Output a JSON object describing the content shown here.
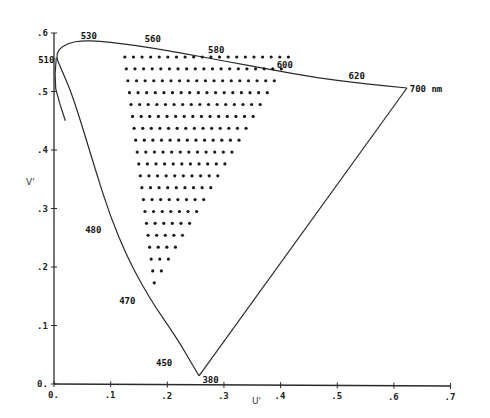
{
  "chart_data": {
    "type": "scatter",
    "title": "",
    "xlabel": "U'",
    "ylabel": "V'",
    "xlim": [
      0,
      0.7
    ],
    "ylim": [
      0,
      0.6
    ],
    "grid": false,
    "legend": null,
    "x_ticks": [
      {
        "value": 0.0,
        "label": "0."
      },
      {
        "value": 0.1,
        "label": ".1"
      },
      {
        "value": 0.2,
        "label": ".2"
      },
      {
        "value": 0.3,
        "label": ".3"
      },
      {
        "value": 0.4,
        "label": ".4"
      },
      {
        "value": 0.5,
        "label": ".5"
      },
      {
        "value": 0.6,
        "label": ".6"
      },
      {
        "value": 0.7,
        "label": ".7"
      }
    ],
    "y_ticks": [
      {
        "value": 0.0,
        "label": "0."
      },
      {
        "value": 0.1,
        "label": ".1"
      },
      {
        "value": 0.2,
        "label": ".2"
      },
      {
        "value": 0.3,
        "label": ".3"
      },
      {
        "value": 0.4,
        "label": ".4"
      },
      {
        "value": 0.5,
        "label": ".5"
      },
      {
        "value": 0.6,
        "label": ".6"
      }
    ],
    "spectral_locus": [
      [
        0.256,
        0.014
      ],
      [
        0.24,
        0.04
      ],
      [
        0.225,
        0.065
      ],
      [
        0.205,
        0.095
      ],
      [
        0.18,
        0.13
      ],
      [
        0.155,
        0.17
      ],
      [
        0.128,
        0.22
      ],
      [
        0.1,
        0.285
      ],
      [
        0.075,
        0.36
      ],
      [
        0.05,
        0.44
      ],
      [
        0.03,
        0.5
      ],
      [
        0.012,
        0.54
      ],
      [
        0.004,
        0.558
      ],
      [
        0.008,
        0.572
      ],
      [
        0.025,
        0.583
      ],
      [
        0.05,
        0.587
      ],
      [
        0.08,
        0.586
      ],
      [
        0.12,
        0.582
      ],
      [
        0.17,
        0.575
      ],
      [
        0.23,
        0.565
      ],
      [
        0.3,
        0.552
      ],
      [
        0.38,
        0.538
      ],
      [
        0.46,
        0.524
      ],
      [
        0.54,
        0.514
      ],
      [
        0.623,
        0.506
      ]
    ],
    "left_branch_extra": [
      [
        0.004,
        0.558
      ],
      [
        0.002,
        0.53
      ],
      [
        0.003,
        0.505
      ],
      [
        0.01,
        0.48
      ],
      [
        0.02,
        0.45
      ]
    ],
    "purple_line": [
      [
        0.623,
        0.506
      ],
      [
        0.256,
        0.014
      ]
    ],
    "wavelength_labels": [
      {
        "label": "380",
        "u": 0.262,
        "v": 0.002
      },
      {
        "label": "450",
        "u": 0.18,
        "v": 0.03
      },
      {
        "label": "470",
        "u": 0.115,
        "v": 0.136
      },
      {
        "label": "480",
        "u": 0.055,
        "v": 0.258
      },
      {
        "label": "510",
        "u": -0.028,
        "v": 0.548
      },
      {
        "label": "530",
        "u": 0.047,
        "v": 0.59
      },
      {
        "label": "560",
        "u": 0.16,
        "v": 0.584
      },
      {
        "label": "580",
        "u": 0.272,
        "v": 0.566
      },
      {
        "label": "600",
        "u": 0.393,
        "v": 0.54
      },
      {
        "label": "620",
        "u": 0.52,
        "v": 0.522
      },
      {
        "label": "700 nm",
        "u": 0.628,
        "v": 0.5
      }
    ],
    "dot_grid": {
      "rows": 20,
      "top_v": 0.559,
      "bottom_v": 0.173,
      "top_left_u": 0.125,
      "bottom_left_u": 0.177,
      "u_spacing": 0.0152,
      "top_row_count": 20,
      "bottom_row_count": 1
    }
  },
  "colors": {
    "line": "#2a2a2a",
    "dots": "#1a1a1a",
    "background": "#ffffff"
  }
}
